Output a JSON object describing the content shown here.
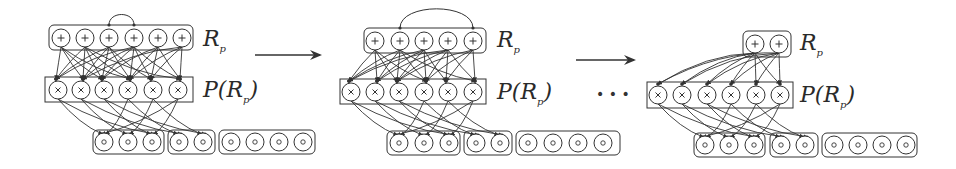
{
  "figure": {
    "ink_color": "#333333",
    "background": "#ffffff",
    "separators": {
      "arrow1": {
        "x1": 255,
        "x2": 320,
        "y": 55
      },
      "arrow2": {
        "x1": 576,
        "x2": 634,
        "y": 60
      },
      "ellipsis": {
        "text": "• • •",
        "x": 596,
        "y": 99
      }
    }
  },
  "panels": [
    {
      "name": "panel-1",
      "sum_layer": {
        "label_main": "R",
        "label_sub": "p",
        "label_x": 203,
        "label_y": 46,
        "box": {
          "x": 49,
          "y": 25,
          "w": 144,
          "h": 25
        },
        "symbol": "+",
        "nodes_x": [
          61,
          85,
          109,
          134,
          158,
          182
        ],
        "node_y": 38,
        "arc": {
          "from": 2,
          "to": 3
        }
      },
      "product_layer": {
        "label_main": "P(",
        "label_inner": "R",
        "label_sub": "p",
        "label_close": ")",
        "label_x": 203,
        "label_y": 97,
        "box": {
          "x": 45,
          "y": 77,
          "w": 148,
          "h": 25
        },
        "symbol": "×",
        "nodes_x": [
          58,
          81,
          104,
          128,
          153,
          178
        ],
        "node_y": 90
      },
      "leaf_layer": {
        "symbol": "∘",
        "node_y": 142,
        "groups": [
          {
            "box": {
              "x": 93,
              "y": 130,
              "w": 71,
              "h": 24
            },
            "nodes_x": [
              104,
              128,
              152
            ]
          },
          {
            "box": {
              "x": 168,
              "y": 130,
              "w": 47,
              "h": 24
            },
            "nodes_x": [
              179,
              203
            ]
          },
          {
            "box": {
              "x": 219,
              "y": 130,
              "w": 96,
              "h": 24
            },
            "nodes_x": [
              231,
              255,
              279,
              303
            ]
          }
        ]
      }
    },
    {
      "name": "panel-2",
      "sum_layer": {
        "label_main": "R",
        "label_sub": "p",
        "label_x": 497,
        "label_y": 47,
        "box": {
          "x": 364,
          "y": 28,
          "w": 122,
          "h": 25
        },
        "symbol": "+",
        "nodes_x": [
          375,
          400,
          424,
          448,
          473
        ],
        "node_y": 41,
        "arc": {
          "from": 1,
          "to": 4
        }
      },
      "product_layer": {
        "label_main": "P(",
        "label_inner": "R",
        "label_sub": "p",
        "label_close": ")",
        "label_x": 497,
        "label_y": 99,
        "box": {
          "x": 340,
          "y": 79,
          "w": 146,
          "h": 25
        },
        "symbol": "×",
        "nodes_x": [
          351,
          375,
          399,
          424,
          448,
          473
        ],
        "node_y": 92
      },
      "leaf_layer": {
        "symbol": "∘",
        "node_y": 143,
        "groups": [
          {
            "box": {
              "x": 387,
              "y": 131,
              "w": 73,
              "h": 24
            },
            "nodes_x": [
              399,
              424,
              449
            ]
          },
          {
            "box": {
              "x": 464,
              "y": 131,
              "w": 48,
              "h": 24
            },
            "nodes_x": [
              476,
              500
            ]
          },
          {
            "box": {
              "x": 516,
              "y": 131,
              "w": 104,
              "h": 24
            },
            "nodes_x": [
              528,
              553,
              578,
              603
            ]
          }
        ]
      }
    },
    {
      "name": "panel-3",
      "sum_layer": {
        "label_main": "R",
        "label_sub": "p",
        "label_x": 800,
        "label_y": 50,
        "box": {
          "x": 743,
          "y": 31,
          "w": 48,
          "h": 26
        },
        "symbol": "+",
        "nodes_x": [
          755,
          779
        ],
        "node_y": 44,
        "arc": null
      },
      "product_layer": {
        "label_main": "P(",
        "label_inner": "R",
        "label_sub": "p",
        "label_close": ")",
        "label_x": 800,
        "label_y": 102,
        "box": {
          "x": 647,
          "y": 82,
          "w": 146,
          "h": 26
        },
        "symbol": "×",
        "nodes_x": [
          658,
          682,
          707,
          731,
          756,
          780
        ],
        "node_y": 95
      },
      "leaf_layer": {
        "symbol": "∘",
        "node_y": 145,
        "groups": [
          {
            "box": {
              "x": 694,
              "y": 133,
              "w": 71,
              "h": 24
            },
            "nodes_x": [
              705,
              729,
              754
            ]
          },
          {
            "box": {
              "x": 770,
              "y": 133,
              "w": 48,
              "h": 24
            },
            "nodes_x": [
              781,
              805
            ]
          },
          {
            "box": {
              "x": 822,
              "y": 133,
              "w": 95,
              "h": 24
            },
            "nodes_x": [
              834,
              858,
              882,
              906
            ]
          }
        ]
      }
    }
  ]
}
